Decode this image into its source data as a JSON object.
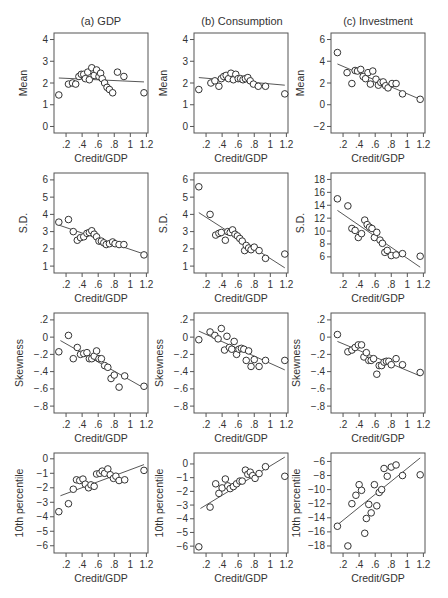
{
  "figure": {
    "columns": [
      "(a) GDP",
      "(b) Consumption",
      "(c) Investment"
    ],
    "x_label": "Credit/GDP",
    "x_ticks": [
      0.2,
      0.4,
      0.6,
      0.8,
      1.0,
      1.2
    ],
    "x_tick_labels": [
      ".2",
      ".4",
      ".6",
      ".8",
      "1",
      "1.2"
    ],
    "x_range": [
      0.05,
      1.22
    ]
  },
  "chart_data": [
    {
      "type": "scatter",
      "title": "(a) GDP",
      "row": 0,
      "col": 0,
      "xlabel": "Credit/GDP",
      "ylabel": "Mean",
      "ylim": [
        -0.3,
        4.3
      ],
      "y_ticks": [
        0,
        1,
        2,
        3,
        4
      ],
      "y_tick_labels": [
        "0",
        "1",
        "2",
        "3",
        "4"
      ],
      "x": [
        0.11,
        0.23,
        0.28,
        0.32,
        0.36,
        0.39,
        0.42,
        0.44,
        0.47,
        0.49,
        0.52,
        0.55,
        0.58,
        0.61,
        0.63,
        0.65,
        0.68,
        0.71,
        0.74,
        0.78,
        0.84,
        0.92,
        1.17
      ],
      "y": [
        1.45,
        1.95,
        2.0,
        1.95,
        2.3,
        2.4,
        2.4,
        2.2,
        2.5,
        2.15,
        2.7,
        2.35,
        2.6,
        2.3,
        2.45,
        2.2,
        2.0,
        1.8,
        1.7,
        1.55,
        2.5,
        2.3,
        1.55
      ],
      "fit": [
        [
          0.11,
          2.23
        ],
        [
          1.17,
          2.05
        ]
      ]
    },
    {
      "type": "scatter",
      "title": "(b) Consumption",
      "row": 0,
      "col": 1,
      "xlabel": "Credit/GDP",
      "ylabel": "Mean",
      "ylim": [
        -0.3,
        4.3
      ],
      "y_ticks": [
        0,
        1,
        2,
        3,
        4
      ],
      "y_tick_labels": [
        "0",
        "1",
        "2",
        "3",
        "4"
      ],
      "x": [
        0.11,
        0.26,
        0.31,
        0.36,
        0.39,
        0.42,
        0.45,
        0.48,
        0.51,
        0.54,
        0.57,
        0.6,
        0.63,
        0.66,
        0.69,
        0.72,
        0.75,
        0.79,
        0.85,
        0.94,
        1.18
      ],
      "y": [
        1.7,
        2.0,
        2.1,
        1.85,
        2.2,
        2.3,
        2.35,
        2.2,
        2.45,
        2.15,
        2.4,
        2.2,
        2.2,
        2.15,
        2.2,
        2.25,
        2.1,
        1.95,
        1.85,
        1.85,
        1.5
      ],
      "fit": [
        [
          0.11,
          2.25
        ],
        [
          1.18,
          1.9
        ]
      ]
    },
    {
      "type": "scatter",
      "title": "(c) Investment",
      "row": 0,
      "col": 2,
      "xlabel": "Credit/GDP",
      "ylabel": "Mean",
      "ylim": [
        -2.6,
        6.6
      ],
      "y_ticks": [
        -2,
        0,
        2,
        4,
        6
      ],
      "y_tick_labels": [
        "−2",
        "0",
        "2",
        "4",
        "6"
      ],
      "x": [
        0.13,
        0.25,
        0.31,
        0.35,
        0.38,
        0.42,
        0.45,
        0.48,
        0.51,
        0.54,
        0.57,
        0.61,
        0.64,
        0.67,
        0.7,
        0.73,
        0.76,
        0.81,
        0.86,
        0.94,
        1.16
      ],
      "y": [
        4.8,
        2.95,
        1.95,
        3.15,
        3.1,
        3.25,
        2.6,
        2.4,
        2.95,
        1.9,
        3.1,
        2.35,
        1.8,
        2.05,
        2.1,
        1.75,
        1.55,
        1.95,
        1.95,
        1.0,
        0.5
      ],
      "fit": [
        [
          0.13,
          3.75
        ],
        [
          1.16,
          0.5
        ]
      ]
    },
    {
      "type": "scatter",
      "title": "",
      "row": 1,
      "col": 0,
      "xlabel": "Credit/GDP",
      "ylabel": "S.D.",
      "ylim": [
        0.6,
        6.4
      ],
      "y_ticks": [
        1,
        2,
        3,
        4,
        5,
        6
      ],
      "y_tick_labels": [
        "1",
        "2",
        "3",
        "4",
        "5",
        "6"
      ],
      "x": [
        0.11,
        0.23,
        0.29,
        0.34,
        0.38,
        0.42,
        0.46,
        0.49,
        0.52,
        0.55,
        0.58,
        0.61,
        0.64,
        0.67,
        0.7,
        0.74,
        0.78,
        0.81,
        0.86,
        0.92,
        1.17
      ],
      "y": [
        3.55,
        3.7,
        3.0,
        2.5,
        2.65,
        2.7,
        2.9,
        2.95,
        3.05,
        2.85,
        2.7,
        2.45,
        2.45,
        2.35,
        2.25,
        2.3,
        2.4,
        2.3,
        2.25,
        2.25,
        1.65
      ],
      "fit": [
        [
          0.11,
          3.38
        ],
        [
          1.17,
          1.7
        ]
      ]
    },
    {
      "type": "scatter",
      "title": "",
      "row": 1,
      "col": 1,
      "xlabel": "Credit/GDP",
      "ylabel": "S.D.",
      "ylim": [
        0.6,
        6.4
      ],
      "y_ticks": [
        1,
        2,
        3,
        4,
        5,
        6
      ],
      "y_tick_labels": [
        "1",
        "2",
        "3",
        "4",
        "5",
        "6"
      ],
      "x": [
        0.11,
        0.25,
        0.32,
        0.36,
        0.39,
        0.44,
        0.47,
        0.5,
        0.53,
        0.56,
        0.59,
        0.62,
        0.65,
        0.68,
        0.7,
        0.73,
        0.76,
        0.8,
        0.86,
        0.94,
        1.18
      ],
      "y": [
        5.6,
        4.0,
        2.8,
        2.9,
        2.95,
        2.5,
        3.0,
        2.95,
        3.1,
        2.85,
        2.75,
        2.6,
        2.45,
        1.9,
        2.2,
        2.05,
        1.95,
        2.1,
        1.9,
        1.45,
        1.7
      ],
      "fit": [
        [
          0.11,
          4.1
        ],
        [
          1.18,
          0.9
        ]
      ]
    },
    {
      "type": "scatter",
      "title": "",
      "row": 1,
      "col": 2,
      "xlabel": "Credit/GDP",
      "ylabel": "S.D.",
      "ylim": [
        3.5,
        19
      ],
      "y_ticks": [
        6,
        8,
        10,
        12,
        14,
        16,
        18
      ],
      "y_tick_labels": [
        "6",
        "8",
        "10",
        "12",
        "14",
        "16",
        "18"
      ],
      "x": [
        0.13,
        0.26,
        0.31,
        0.35,
        0.39,
        0.43,
        0.47,
        0.5,
        0.53,
        0.56,
        0.59,
        0.62,
        0.66,
        0.69,
        0.72,
        0.75,
        0.8,
        0.86,
        0.94,
        1.16
      ],
      "y": [
        15.0,
        13.9,
        10.4,
        10.1,
        9.0,
        9.6,
        11.7,
        11.0,
        10.6,
        10.4,
        9.0,
        9.8,
        8.6,
        8.1,
        6.7,
        7.0,
        6.2,
        6.3,
        6.5,
        6.1
      ],
      "fit": [
        [
          0.13,
          13.2
        ],
        [
          1.16,
          4.4
        ]
      ]
    },
    {
      "type": "scatter",
      "title": "",
      "row": 2,
      "col": 0,
      "xlabel": "Credit/GDP",
      "ylabel": "Skewness",
      "ylim": [
        -0.88,
        0.28
      ],
      "y_ticks": [
        0.2,
        0,
        -0.2,
        -0.4,
        -0.6,
        -0.8
      ],
      "y_tick_labels": [
        ".2",
        "0",
        "−.2",
        "−.4",
        "−.6",
        "−.8"
      ],
      "x": [
        0.11,
        0.23,
        0.29,
        0.34,
        0.38,
        0.42,
        0.46,
        0.49,
        0.52,
        0.55,
        0.58,
        0.61,
        0.64,
        0.68,
        0.72,
        0.76,
        0.8,
        0.86,
        0.93,
        1.17
      ],
      "y": [
        -0.17,
        0.02,
        -0.25,
        -0.12,
        -0.2,
        -0.19,
        -0.18,
        -0.25,
        -0.25,
        -0.22,
        -0.16,
        -0.25,
        -0.25,
        -0.33,
        -0.35,
        -0.48,
        -0.44,
        -0.58,
        -0.45,
        -0.57
      ],
      "fit": [
        [
          0.13,
          -0.04
        ],
        [
          1.17,
          -0.59
        ]
      ]
    },
    {
      "type": "scatter",
      "title": "",
      "row": 2,
      "col": 1,
      "xlabel": "Credit/GDP",
      "ylabel": "Skewness",
      "ylim": [
        -0.88,
        0.28
      ],
      "y_ticks": [
        0.2,
        0,
        -0.2,
        -0.4,
        -0.6,
        -0.8
      ],
      "y_tick_labels": [
        ".2",
        "0",
        "−.2",
        "−.4",
        "−.6",
        "−.8"
      ],
      "x": [
        0.11,
        0.25,
        0.31,
        0.35,
        0.39,
        0.43,
        0.46,
        0.49,
        0.52,
        0.55,
        0.58,
        0.61,
        0.64,
        0.67,
        0.7,
        0.73,
        0.76,
        0.8,
        0.86,
        0.94,
        1.18
      ],
      "y": [
        -0.03,
        0.06,
        0.02,
        -0.02,
        0.1,
        -0.15,
        0.01,
        -0.12,
        -0.14,
        -0.05,
        -0.2,
        -0.14,
        -0.13,
        -0.14,
        -0.27,
        -0.16,
        -0.34,
        -0.26,
        -0.34,
        -0.27,
        -0.27
      ],
      "fit": [
        [
          0.11,
          0.07
        ],
        [
          1.18,
          -0.38
        ]
      ]
    },
    {
      "type": "scatter",
      "title": "",
      "row": 2,
      "col": 2,
      "xlabel": "Credit/GDP",
      "ylabel": "Skewness",
      "ylim": [
        -0.88,
        0.28
      ],
      "y_ticks": [
        0.2,
        0,
        -0.2,
        -0.4,
        -0.6,
        -0.8
      ],
      "y_tick_labels": [
        ".2",
        "0",
        "−.2",
        "−.4",
        "−.6",
        "−.8"
      ],
      "x": [
        0.13,
        0.26,
        0.31,
        0.35,
        0.39,
        0.43,
        0.46,
        0.49,
        0.52,
        0.55,
        0.58,
        0.62,
        0.65,
        0.68,
        0.71,
        0.74,
        0.77,
        0.8,
        0.86,
        0.94,
        1.16
      ],
      "y": [
        0.03,
        -0.17,
        -0.15,
        -0.12,
        -0.09,
        -0.09,
        -0.23,
        -0.18,
        -0.27,
        -0.27,
        -0.25,
        -0.43,
        -0.33,
        -0.33,
        -0.29,
        -0.28,
        -0.28,
        -0.32,
        -0.25,
        -0.32,
        -0.41
      ],
      "fit": [
        [
          0.13,
          -0.05
        ],
        [
          1.16,
          -0.45
        ]
      ]
    },
    {
      "type": "scatter",
      "title": "",
      "row": 3,
      "col": 0,
      "xlabel": "Credit/GDP",
      "ylabel": "10th percentile",
      "ylim": [
        -6.5,
        0.4
      ],
      "y_ticks": [
        0,
        -1,
        -2,
        -3,
        -4,
        -5,
        -6
      ],
      "y_tick_labels": [
        "0",
        "−1",
        "−2",
        "−3",
        "−4",
        "−5",
        "−6"
      ],
      "x": [
        0.11,
        0.23,
        0.29,
        0.33,
        0.37,
        0.41,
        0.44,
        0.48,
        0.51,
        0.55,
        0.58,
        0.62,
        0.65,
        0.68,
        0.72,
        0.75,
        0.79,
        0.82,
        0.86,
        0.93,
        1.17
      ],
      "y": [
        -3.65,
        -3.1,
        -2.1,
        -1.45,
        -1.5,
        -1.4,
        -1.75,
        -2.0,
        -1.8,
        -1.9,
        -1.05,
        -1.0,
        -0.85,
        -1.0,
        -0.7,
        -1.1,
        -1.35,
        -1.2,
        -1.5,
        -1.45,
        -0.8
      ],
      "fit": [
        [
          0.13,
          -2.55
        ],
        [
          1.17,
          -0.4
        ]
      ]
    },
    {
      "type": "scatter",
      "title": "",
      "row": 3,
      "col": 1,
      "xlabel": "Credit/GDP",
      "ylabel": "10th percentile",
      "ylim": [
        -6.5,
        0.8
      ],
      "y_ticks": [
        0,
        -1,
        -2,
        -3,
        -4,
        -5,
        -6
      ],
      "y_tick_labels": [
        "0",
        "−1",
        "−2",
        "−3",
        "−4",
        "−5",
        "−6"
      ],
      "x": [
        0.11,
        0.25,
        0.32,
        0.36,
        0.4,
        0.44,
        0.47,
        0.5,
        0.54,
        0.58,
        0.62,
        0.65,
        0.69,
        0.72,
        0.75,
        0.78,
        0.81,
        0.86,
        0.94,
        1.18
      ],
      "y": [
        -6.05,
        -3.15,
        -1.45,
        -2.15,
        -1.75,
        -1.1,
        -1.6,
        -1.8,
        -1.65,
        -1.45,
        -1.25,
        -1.25,
        -0.45,
        -0.75,
        -0.6,
        -0.85,
        -1.05,
        -0.7,
        -0.2,
        -0.9
      ],
      "fit": [
        [
          0.13,
          -3.25
        ],
        [
          1.18,
          0.5
        ]
      ]
    },
    {
      "type": "scatter",
      "title": "",
      "row": 3,
      "col": 2,
      "xlabel": "Credit/GDP",
      "ylabel": "10th percentile",
      "ylim": [
        -19,
        -4.8
      ],
      "y_ticks": [
        -6,
        -8,
        -10,
        -12,
        -14,
        -16,
        -18
      ],
      "y_tick_labels": [
        "−6",
        "−8",
        "−10",
        "−12",
        "−14",
        "−16",
        "−18"
      ],
      "x": [
        0.13,
        0.26,
        0.31,
        0.36,
        0.4,
        0.43,
        0.47,
        0.49,
        0.52,
        0.55,
        0.59,
        0.62,
        0.65,
        0.68,
        0.71,
        0.75,
        0.8,
        0.86,
        0.94,
        1.16
      ],
      "y": [
        -15.2,
        -18.0,
        -12.0,
        -10.8,
        -9.3,
        -10.1,
        -16.2,
        -14.1,
        -12.1,
        -13.3,
        -9.3,
        -12.3,
        -10.4,
        -10.0,
        -7.0,
        -8.1,
        -6.8,
        -6.5,
        -8.0,
        -7.9
      ],
      "fit": [
        [
          0.13,
          -15.0
        ],
        [
          1.16,
          -5.5
        ]
      ]
    }
  ]
}
